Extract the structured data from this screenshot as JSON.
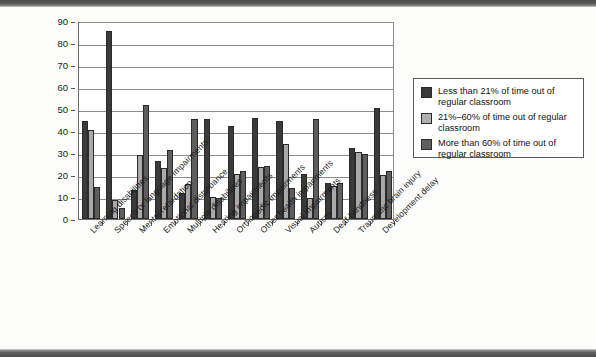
{
  "chart_data": {
    "type": "bar",
    "title": "",
    "subtitle": "",
    "xlabel": "",
    "ylabel": "",
    "ylim": [
      0,
      90
    ],
    "ytick_step": 10,
    "yticks": [
      0,
      10,
      20,
      30,
      40,
      50,
      60,
      70,
      80,
      90
    ],
    "grid": true,
    "legend_position": "right",
    "categories": [
      "Learning disabilities",
      "Speech or language impairments",
      "Mental retardation",
      "Emotional disturbance",
      "Multiple disabilities",
      "Hearing impairments",
      "Orthopedic impairments",
      "Other health impairments",
      "Visual impairments",
      "Autism",
      "Deaf-blindness",
      "Traumatic brain injury",
      "Development delay"
    ],
    "series": [
      {
        "name": "Less than 21% of time out of regular classroom",
        "color": "#3a3a3a",
        "values": [
          44.5,
          85.5,
          13.0,
          26.5,
          11.8,
          45.5,
          42.5,
          46.0,
          44.5,
          20.5,
          16.5,
          32.5,
          50.5
        ]
      },
      {
        "name": "21%–60% of time out of regular classroom",
        "color": "#a9a9a9",
        "values": [
          40.5,
          8.5,
          29.0,
          23.0,
          16.0,
          10.0,
          20.5,
          23.5,
          34.0,
          9.5,
          15.0,
          30.5,
          20.0
        ]
      },
      {
        "name": "More than 60% of time out of regular classroom",
        "color": "#5e5e5e",
        "values": [
          14.5,
          5.0,
          52.0,
          31.5,
          45.5,
          9.5,
          22.0,
          24.0,
          14.0,
          45.5,
          16.5,
          29.5,
          22.0
        ]
      }
    ]
  },
  "legend": {
    "items": [
      {
        "swatch": "series-0-swatch",
        "label": "Less than 21% of time out of regular classroom"
      },
      {
        "swatch": "series-1-swatch",
        "label": "21%–60% of time out of regular classroom"
      },
      {
        "swatch": "series-2-swatch",
        "label": "More than 60% of time out of regular classroom"
      }
    ]
  }
}
